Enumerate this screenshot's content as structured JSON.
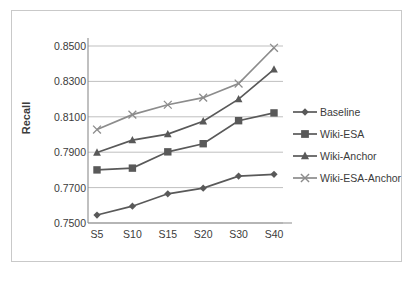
{
  "chart_data": {
    "type": "line",
    "title": "",
    "xlabel": "",
    "ylabel": "Recall",
    "categories": [
      "S5",
      "S10",
      "S15",
      "S20",
      "S30",
      "S40"
    ],
    "ylim": [
      0.75,
      0.85
    ],
    "yticks": [
      "0.7500",
      "0.7700",
      "0.7900",
      "0.8100",
      "0.8300",
      "0.8500"
    ],
    "ytick_values": [
      0.75,
      0.77,
      0.79,
      0.81,
      0.83,
      0.85
    ],
    "grid": true,
    "legend_position": "right",
    "series": [
      {
        "name": "Baseline",
        "marker": "diamond",
        "color": "#595959",
        "values": [
          0.7545,
          0.7595,
          0.7665,
          0.7697,
          0.7765,
          0.7775
        ]
      },
      {
        "name": "Wiki-ESA",
        "marker": "square",
        "color": "#595959",
        "values": [
          0.78,
          0.781,
          0.7902,
          0.7948,
          0.8078,
          0.8122
        ]
      },
      {
        "name": "Wiki-Anchor",
        "marker": "triangle",
        "color": "#595959",
        "values": [
          0.7898,
          0.7968,
          0.8002,
          0.8075,
          0.82,
          0.8368
        ]
      },
      {
        "name": "Wiki-ESA-Anchor",
        "marker": "cross",
        "color": "#8c8c8c",
        "values": [
          0.8028,
          0.8112,
          0.8168,
          0.8208,
          0.8288,
          0.849
        ]
      }
    ]
  },
  "axis": {
    "ylabel": "Recall"
  },
  "colors": {
    "series_dark": "#595959",
    "series_light": "#8c8c8c",
    "grid": "#b8b8b8",
    "axis": "#8c8c8c",
    "frame": "#c9c9c9",
    "text": "#3b3b3b"
  }
}
